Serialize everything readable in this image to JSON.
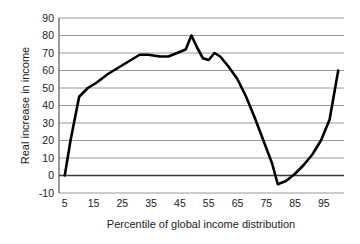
{
  "chart_data": {
    "type": "line",
    "title": "",
    "subtitle": "",
    "xlabel": "Percentile of global income distribution",
    "ylabel": "Real increase in income",
    "xlim": [
      3,
      102
    ],
    "ylim": [
      -10,
      90
    ],
    "grid": true,
    "legend": null,
    "legend_position": "none",
    "y_ticks": [
      90,
      80,
      70,
      60,
      50,
      40,
      30,
      20,
      10,
      0,
      -10
    ],
    "y_tick_labels": [
      "90",
      "80",
      "70",
      "60",
      "50",
      "40",
      "30",
      "20",
      "10",
      "0",
      "-10"
    ],
    "x_ticks": [
      5,
      15,
      25,
      35,
      45,
      55,
      65,
      75,
      85,
      95
    ],
    "x_tick_labels": [
      "5",
      "15",
      "25",
      "35",
      "45",
      "55",
      "65",
      "75",
      "85",
      "95"
    ],
    "series": [
      {
        "name": "Real increase in income",
        "color": "#000000",
        "x": [
          5,
          7,
          10,
          13,
          16,
          20,
          24,
          28,
          31,
          34,
          38,
          41,
          44,
          47,
          49,
          51,
          53,
          55,
          57,
          59,
          62,
          65,
          68,
          71,
          74,
          77,
          79,
          82,
          85,
          88,
          91,
          94,
          97,
          100
        ],
        "values": [
          0,
          20,
          45,
          50,
          53,
          58,
          62,
          66,
          69,
          69,
          68,
          68,
          70,
          72,
          80,
          73,
          67,
          66,
          70,
          68,
          62,
          55,
          45,
          33,
          20,
          7,
          -5,
          -3,
          1,
          6,
          12,
          20,
          32,
          60
        ]
      }
    ],
    "annotations": []
  },
  "axis_labels": {
    "y_title": "Real increase in income",
    "x_title": "Percentile of global income distribution"
  },
  "colors": {
    "line": "#000000",
    "grid": "#8d8d8d",
    "zero_line": "#3a3a3a",
    "background": "#ffffff",
    "text": "#1a1a1a"
  }
}
